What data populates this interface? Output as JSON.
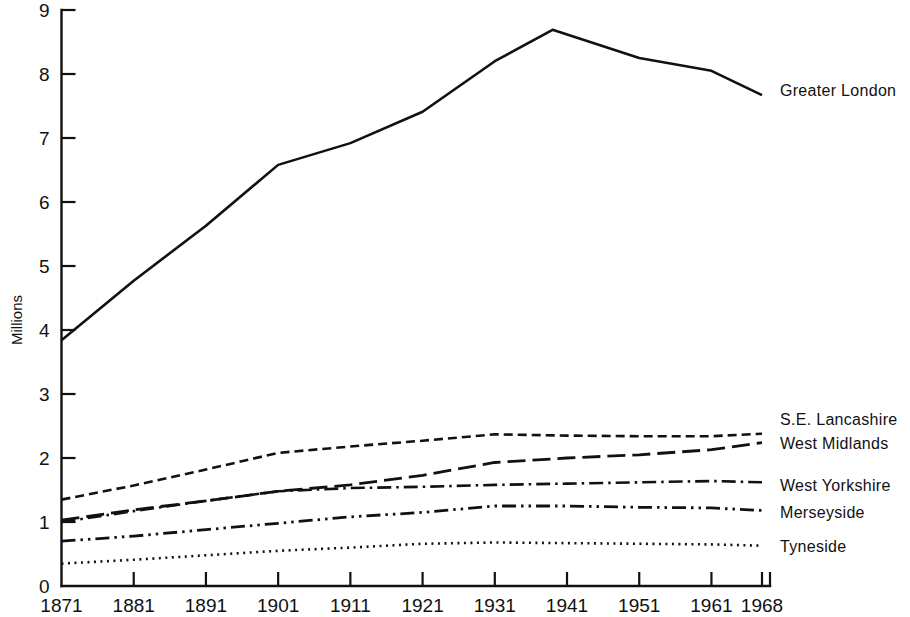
{
  "chart_data": {
    "type": "line",
    "title": "",
    "subtitle": "",
    "xlabel": "",
    "ylabel": "Millions",
    "xlim": [
      1871,
      1968
    ],
    "ylim": [
      0,
      9
    ],
    "grid": false,
    "legend_position": "right-inline",
    "x_tick_labels": [
      "1871",
      "1881",
      "1891",
      "1901",
      "1911",
      "1921",
      "1931",
      "1941",
      "1951",
      "1961",
      "1968"
    ],
    "x_ticks": [
      1871,
      1881,
      1891,
      1901,
      1911,
      1921,
      1931,
      1941,
      1951,
      1961,
      1968
    ],
    "y_tick_labels": [
      "0",
      "1",
      "2",
      "3",
      "4",
      "5",
      "6",
      "7",
      "8",
      "9"
    ],
    "y_ticks": [
      0,
      1,
      2,
      3,
      4,
      5,
      6,
      7,
      8,
      9
    ],
    "series": [
      {
        "name": "Greater London",
        "style": "solid",
        "x": [
          1871,
          1881,
          1891,
          1901,
          1911,
          1921,
          1931,
          1939,
          1951,
          1961,
          1968
        ],
        "values": [
          3.84,
          4.77,
          5.63,
          6.58,
          6.92,
          7.41,
          8.2,
          8.69,
          8.25,
          8.05,
          7.67
        ]
      },
      {
        "name": "S.E. Lancashire",
        "style": "dashed",
        "x": [
          1871,
          1881,
          1891,
          1901,
          1911,
          1921,
          1931,
          1941,
          1951,
          1961,
          1968
        ],
        "values": [
          1.35,
          1.57,
          1.82,
          2.08,
          2.18,
          2.27,
          2.37,
          2.35,
          2.34,
          2.34,
          2.38
        ]
      },
      {
        "name": "West Midlands",
        "style": "long-dash",
        "x": [
          1871,
          1881,
          1891,
          1901,
          1911,
          1921,
          1931,
          1941,
          1951,
          1961,
          1968
        ],
        "values": [
          1.03,
          1.19,
          1.33,
          1.48,
          1.58,
          1.73,
          1.93,
          2.0,
          2.05,
          2.13,
          2.24
        ]
      },
      {
        "name": "West Yorkshire",
        "style": "dash-dot",
        "x": [
          1871,
          1881,
          1891,
          1901,
          1911,
          1921,
          1931,
          1941,
          1951,
          1961,
          1968
        ],
        "values": [
          1.0,
          1.17,
          1.33,
          1.48,
          1.53,
          1.55,
          1.58,
          1.6,
          1.62,
          1.64,
          1.62
        ]
      },
      {
        "name": "Merseyside",
        "style": "dash-dot-dot",
        "x": [
          1871,
          1881,
          1891,
          1901,
          1911,
          1921,
          1931,
          1941,
          1951,
          1961,
          1968
        ],
        "values": [
          0.7,
          0.78,
          0.88,
          0.98,
          1.08,
          1.15,
          1.25,
          1.25,
          1.23,
          1.22,
          1.18
        ]
      },
      {
        "name": "Tyneside",
        "style": "dotted",
        "x": [
          1871,
          1881,
          1891,
          1901,
          1911,
          1921,
          1931,
          1941,
          1951,
          1961,
          1968
        ],
        "values": [
          0.35,
          0.41,
          0.48,
          0.55,
          0.6,
          0.66,
          0.68,
          0.67,
          0.66,
          0.65,
          0.63
        ]
      }
    ],
    "annotations": [
      {
        "text": "Greater London",
        "x": 1968,
        "y": 7.67
      },
      {
        "text": "S.E. Lancashire",
        "x": 1968,
        "y": 2.45
      },
      {
        "text": "West Midlands",
        "x": 1968,
        "y": 2.15
      },
      {
        "text": "West Yorkshire",
        "x": 1968,
        "y": 1.62
      },
      {
        "text": "Merseyside",
        "x": 1968,
        "y": 1.2
      },
      {
        "text": "Tyneside",
        "x": 1968,
        "y": 0.63
      }
    ],
    "colors": {
      "ink": "#111111",
      "background": "#ffffff"
    }
  },
  "labels": {
    "y_axis_title": "Millions",
    "series_0": "Greater London",
    "series_1": "S.E. Lancashire",
    "series_2": "West Midlands",
    "series_3": "West Yorkshire",
    "series_4": "Merseyside",
    "series_5": "Tyneside"
  }
}
